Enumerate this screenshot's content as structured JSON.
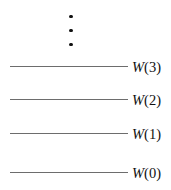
{
  "figure": {
    "type": "math-diagram",
    "width": 171,
    "height": 190,
    "background_color": "#ffffff",
    "line_color": "#6d6d6d",
    "text_color": "#111111",
    "ellipsis": {
      "glyph": "vertical-ellipsis",
      "dot_count": 3,
      "meaning": "continues upward"
    },
    "levels": [
      {
        "symbol": "W",
        "open_paren": "(",
        "index": "3",
        "close_paren": ")",
        "label": "W(3)"
      },
      {
        "symbol": "W",
        "open_paren": "(",
        "index": "2",
        "close_paren": ")",
        "label": "W(2)"
      },
      {
        "symbol": "W",
        "open_paren": "(",
        "index": "1",
        "close_paren": ")",
        "label": "W(1)"
      },
      {
        "symbol": "W",
        "open_paren": "(",
        "index": "0",
        "close_paren": ")",
        "label": "W(0)"
      }
    ]
  }
}
